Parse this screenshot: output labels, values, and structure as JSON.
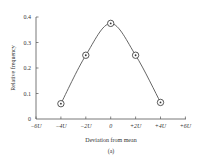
{
  "chart_data": {
    "type": "line",
    "title": "",
    "xlabel": "Deviation from mean",
    "ylabel": "Relative frequency",
    "caption": "(a)",
    "x_categories": [
      "-6U",
      "-4U",
      "-2U",
      "0",
      "+2U",
      "+4U",
      "+6U"
    ],
    "x_tick_labels": [
      "−6U",
      "−4U",
      "−2U",
      "0",
      "+2U",
      "+4U",
      "+6U"
    ],
    "x": [
      -4,
      -2,
      0,
      2,
      4
    ],
    "x_units": "U",
    "values": [
      0.06,
      0.25,
      0.375,
      0.25,
      0.065
    ],
    "series": [
      {
        "name": "Relative frequency",
        "marker": "circled-dot",
        "smooth": true,
        "points": [
          {
            "x": "-4U",
            "y": 0.06
          },
          {
            "x": "-2U",
            "y": 0.25
          },
          {
            "x": "0",
            "y": 0.375
          },
          {
            "x": "+2U",
            "y": 0.25
          },
          {
            "x": "+4U",
            "y": 0.065
          }
        ]
      }
    ],
    "y_ticks": [
      0,
      0.1,
      0.2,
      0.3,
      0.4
    ],
    "y_tick_labels": [
      "0",
      "0.1",
      "0.2",
      "0.3",
      "0.4"
    ],
    "xlim": [
      -6,
      6
    ],
    "ylim": [
      0,
      0.4
    ],
    "grid": false,
    "legend": null,
    "colors": {
      "line": "#555555",
      "axis": "#555555",
      "text": "#333333"
    }
  }
}
